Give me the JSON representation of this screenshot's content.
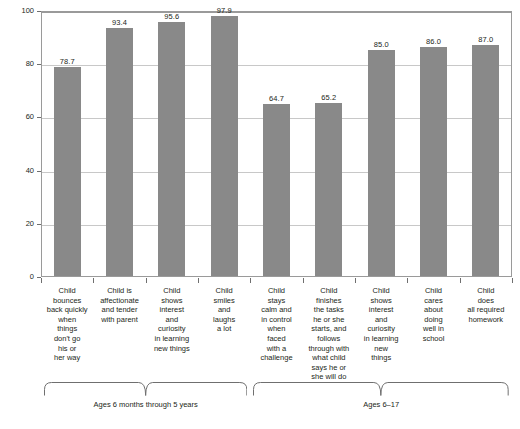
{
  "chart_data": {
    "type": "bar",
    "title": "",
    "xlabel": "",
    "ylabel": "Percent",
    "ylim": [
      0,
      100
    ],
    "yticks": [
      0,
      20,
      40,
      60,
      80,
      100
    ],
    "grid": true,
    "legend": "none",
    "bar_color": "#898989",
    "categories": [
      "Child bounces back quickly when things don't go his or her way",
      "Child is affectionate and tender with parent",
      "Child shows interest and curiosity in learning new things",
      "Child smiles and laughs a lot",
      "Child stays calm and in control when faced with a challenge",
      "Child finishes the tasks he or she starts, and follows through with what child says he or she will do",
      "Child shows interest and curiosity in learning new things",
      "Child cares about doing well in school",
      "Child does all required homework"
    ],
    "category_lines": [
      [
        "Child",
        "bounces",
        "back quickly",
        "when",
        "things",
        "don't go",
        "his or",
        "her way"
      ],
      [
        "Child is",
        "affectionate",
        "and tender",
        "with parent"
      ],
      [
        "Child",
        "shows",
        "interest",
        "and",
        "curiosity",
        "in learning",
        "new things"
      ],
      [
        "Child",
        "smiles",
        "and",
        "laughs",
        "a lot"
      ],
      [
        "Child",
        "stays",
        "calm and",
        "in control",
        "when",
        "faced",
        "with a",
        "challenge"
      ],
      [
        "Child",
        "finishes",
        "the tasks",
        "he or she",
        "starts, and",
        "follows",
        "through with",
        "what child",
        "says he or",
        "she will do"
      ],
      [
        "Child",
        "shows",
        "interest",
        "and",
        "curiosity",
        "in learning",
        "new",
        "things"
      ],
      [
        "Child",
        "cares",
        "about",
        "doing",
        "well in",
        "school"
      ],
      [
        "Child",
        "does",
        "all required",
        "homework"
      ]
    ],
    "values": [
      78.7,
      93.4,
      95.6,
      97.9,
      64.7,
      65.2,
      85.0,
      86.0,
      87.0
    ],
    "value_labels": [
      "78.7",
      "93.4",
      "95.6",
      "97.9",
      "64.7",
      "65.2",
      "85.0",
      "86.0",
      "87.0"
    ],
    "groups": [
      {
        "label": "Ages 6 months through 5 years",
        "start": 0,
        "end": 3
      },
      {
        "label": "Ages 6–17",
        "start": 4,
        "end": 8
      }
    ]
  }
}
